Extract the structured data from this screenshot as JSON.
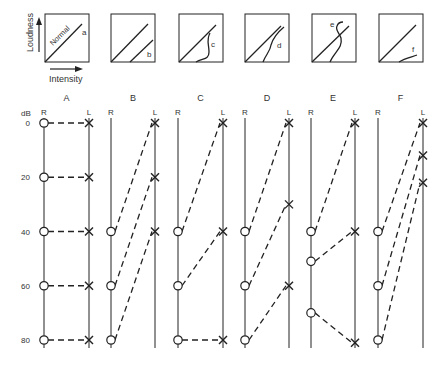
{
  "top_panels": {
    "y_axis_label": "Loudness",
    "x_axis_label": "Intensity",
    "normal_label": "Normal",
    "panels": [
      {
        "id": "a",
        "x": 45,
        "curve": "none"
      },
      {
        "id": "b",
        "x": 111,
        "curve": "parallel-shift"
      },
      {
        "id": "c",
        "x": 179,
        "curve": "complete-recruitment"
      },
      {
        "id": "d",
        "x": 245,
        "curve": "partial-recruitment"
      },
      {
        "id": "e",
        "x": 312,
        "curve": "over-recruitment"
      },
      {
        "id": "f",
        "x": 379,
        "curve": "decruitment"
      }
    ]
  },
  "ladder": {
    "y_unit": "dB",
    "y_ticks": [
      0,
      20,
      40,
      60,
      80
    ],
    "ear_labels": {
      "right": "R",
      "left": "L"
    },
    "right_marker": "circle",
    "left_marker": "cross",
    "columns": [
      {
        "label": "A",
        "rx": 44,
        "lx": 89,
        "right_dB": [
          0,
          20,
          40,
          60,
          80
        ],
        "left_dB": [
          0,
          20,
          40,
          60,
          80
        ]
      },
      {
        "label": "B",
        "rx": 111,
        "lx": 155,
        "right_dB": [
          40,
          60,
          80
        ],
        "left_dB": [
          0,
          20,
          40
        ]
      },
      {
        "label": "C",
        "rx": 178,
        "lx": 223,
        "right_dB": [
          40,
          60,
          80
        ],
        "left_dB": [
          0,
          40,
          80
        ]
      },
      {
        "label": "D",
        "rx": 245,
        "lx": 289,
        "right_dB": [
          40,
          60,
          80
        ],
        "left_dB": [
          0,
          30,
          60
        ]
      },
      {
        "label": "E",
        "rx": 311,
        "lx": 355,
        "right_dB": [
          40,
          51,
          70
        ],
        "left_dB": [
          0,
          40,
          81
        ]
      },
      {
        "label": "F",
        "rx": 378,
        "lx": 423,
        "right_dB": [
          40,
          60,
          80
        ],
        "left_dB": [
          0,
          12,
          22
        ]
      }
    ]
  }
}
